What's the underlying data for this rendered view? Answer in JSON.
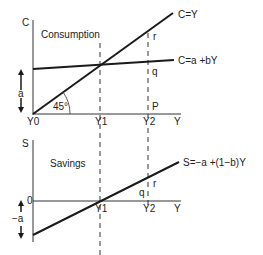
{
  "colors": {
    "line": "#1a1a1a",
    "axis": "#333333",
    "text": "#222222",
    "background": "#ffffff"
  },
  "top_panel": {
    "title": "Consumption",
    "y_axis_label": "C",
    "x_axis_label": "Y",
    "x_ticks": [
      "Y0",
      "Y1",
      "Y2"
    ],
    "angle_label": "45°",
    "intercept_label": "a",
    "curves": [
      {
        "name": "45-degree line",
        "label": "C=Y"
      },
      {
        "name": "consumption function",
        "label": "C=a +bY"
      }
    ],
    "points": [
      "r",
      "q",
      "P"
    ]
  },
  "bottom_panel": {
    "title": "Savings",
    "y_axis_label": "S",
    "x_axis_label": "Y",
    "origin_label": "0",
    "x_ticks": [
      "Y1",
      "Y2"
    ],
    "intercept_label": "−a",
    "curves": [
      {
        "name": "savings function",
        "label": "S=−a +(1−b)Y"
      }
    ],
    "points": [
      "q",
      "r"
    ]
  }
}
